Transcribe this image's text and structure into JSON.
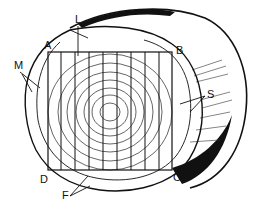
{
  "diagram": {
    "colors": {
      "ink": "#111111",
      "background": "#ffffff"
    },
    "labels": [
      {
        "id": "L",
        "text": "L",
        "x": 75,
        "y": 14
      },
      {
        "id": "A",
        "text": "A",
        "x": 44,
        "y": 40
      },
      {
        "id": "B",
        "text": "B",
        "x": 176,
        "y": 45
      },
      {
        "id": "M",
        "text": "M",
        "x": 14,
        "y": 60
      },
      {
        "id": "S",
        "text": "S",
        "x": 207,
        "y": 89
      },
      {
        "id": "D",
        "text": "D",
        "x": 40,
        "y": 174
      },
      {
        "id": "C",
        "text": "C",
        "x": 173,
        "y": 172
      },
      {
        "id": "F",
        "text": "F",
        "x": 62,
        "y": 190
      }
    ],
    "square": {
      "A": [
        48,
        52
      ],
      "B": [
        172,
        52
      ],
      "C": [
        172,
        170
      ],
      "D": [
        48,
        170
      ]
    },
    "cut_lines_x": [
      61,
      75,
      89,
      103,
      117,
      131,
      145,
      159
    ]
  }
}
